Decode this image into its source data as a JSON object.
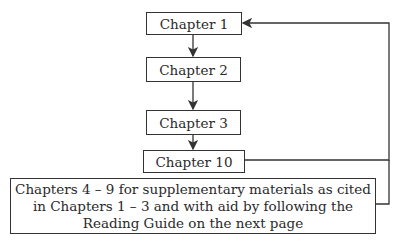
{
  "diagram": {
    "nodes": [
      {
        "id": "ch1",
        "label": "Chapter 1"
      },
      {
        "id": "ch2",
        "label": "Chapter 2"
      },
      {
        "id": "ch3",
        "label": "Chapter 3"
      },
      {
        "id": "ch10",
        "label": "Chapter 10"
      },
      {
        "id": "supp",
        "lines": [
          "Chapters 4 – 9 for supplementary materials as cited",
          "in Chapters 1 – 3 and with aid by following the",
          "Reading Guide on the next page"
        ]
      }
    ],
    "edges": [
      {
        "from": "ch1",
        "to": "ch2"
      },
      {
        "from": "ch2",
        "to": "ch3"
      },
      {
        "from": "ch3",
        "to": "ch10"
      },
      {
        "from": "ch10",
        "to": "ch1",
        "route": "right-loop"
      },
      {
        "from": "supp",
        "to": "ch1",
        "route": "right-loop"
      }
    ],
    "colors": {
      "line": "#333333",
      "background": "#ffffff"
    }
  }
}
